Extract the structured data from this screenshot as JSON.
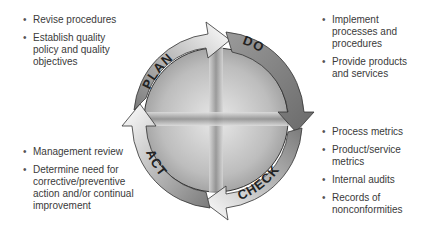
{
  "diagram": {
    "phases": [
      {
        "key": "plan",
        "label": "PLAN"
      },
      {
        "key": "do",
        "label": "DO"
      },
      {
        "key": "check",
        "label": "CHECK"
      },
      {
        "key": "act",
        "label": "ACT"
      }
    ]
  },
  "plan": {
    "items": [
      "Revise procedures",
      "Establish quality policy and quality objectives"
    ]
  },
  "do": {
    "items": [
      "Implement processes and procedures",
      "Provide products and services"
    ]
  },
  "check": {
    "items": [
      "Process metrics",
      "Product/service metrics",
      "Internal audits",
      "Records of nonconformities"
    ]
  },
  "act": {
    "items": [
      "Management review",
      "Determine need for corrective/preventive action and/or continual improvement"
    ]
  },
  "colors": {
    "ring_dark": "#8a8a8a",
    "ring_light": "#f2f2f2",
    "outline": "#333333",
    "text": "#3a3a3a"
  }
}
